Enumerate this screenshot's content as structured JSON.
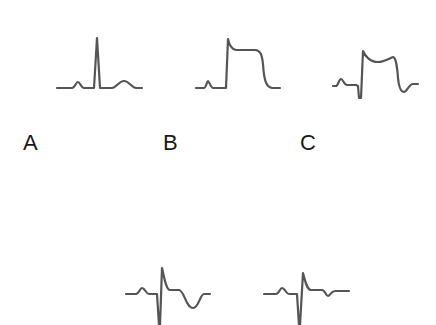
{
  "figure": {
    "trace_color": "#555555",
    "panels": [
      {
        "label": "A",
        "description": "Normal ECG complex: P wave, narrow tall QRS, upright T wave",
        "path": "M57,88 L72,88 C75,88 76,82 78,82 C80,82 81,88 84,88 L94,88 L97,38 L100,88 L112,88 C116,88 119,81 124,81 C129,81 132,88 136,88 L142,88"
      },
      {
        "label": "B",
        "description": "ST-segment elevation (tombstone): QRS merging into elevated plateau",
        "path": "M196,88 L204,88 C206,88 207,81 208,81 C209,81 211,88 213,88 L226,88 L228,39 C229,44 231,49 236,50 L255,50 C260,50 262,54 263,64 C264,80 266,87 272,88 L280,88"
      },
      {
        "label": "C",
        "description": "Q wave with convex ST elevation",
        "path": "M333,86 L336,86 C338,86 339,79 341,79 C343,79 344,85 347,85 L356,85 L358,86 L359,98 L361,98 L363,51 C365,56 370,62 378,62 C384,62 390,58 393,57 C396,58 397,65 398,78 C399,88 401,92 404,92 C407,92 409,84 413,84 L418,84"
      }
    ],
    "bottom_panels": [
      {
        "label": "D",
        "description": "Deep S wave, small R, inverted deep T wave",
        "path": "M126,294 L136,294 C139,294 140,288 142,288 C145,288 146,294 149,294 L157,294 L159,325 L160,325 L162,268 C164,276 166,290 170,290 L179,290 C184,290 186,308 193,308 C199,308 200,294 204,294 L210,294"
      },
      {
        "label": "E",
        "description": "Deep S wave, small R, shallow T wave inversion",
        "path": "M264,294 L276,294 C279,294 280,288 282,288 C285,288 286,294 289,294 L297,294 L299,325 L300,325 L303,273 C305,281 307,290 311,290 L322,290 C325,290 326,296 328,296 C330,296 331,291 335,291 L349,291"
      }
    ],
    "labels": [
      {
        "text": "A",
        "x": 23,
        "y": 132
      },
      {
        "text": "B",
        "x": 163,
        "y": 132
      },
      {
        "text": "C",
        "x": 300,
        "y": 132
      }
    ]
  }
}
